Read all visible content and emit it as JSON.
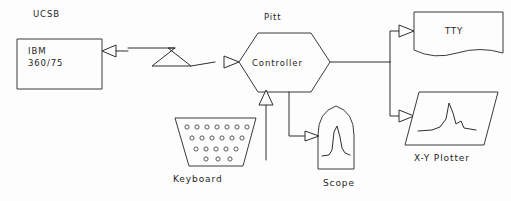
{
  "diagram": {
    "background_color": "#fdfdfd",
    "line_color": "#2e2e2e",
    "text_color": "#1e1e1e"
  },
  "nodes": {
    "mainframe": {
      "outer_label": "UCSB",
      "line1": "IBM",
      "line2": "360/75",
      "shape": "rectangle"
    },
    "controller": {
      "outer_label": "Pitt",
      "label": "Controller",
      "shape": "hexagon"
    },
    "keyboard": {
      "label": "Keyboard",
      "shape": "trapezoid",
      "key_rows": [
        7,
        6,
        5,
        3
      ]
    },
    "scope": {
      "label": "Scope",
      "shape": "crt-rounded-top",
      "display": "waveform-peak"
    },
    "tty": {
      "label": "TTY",
      "shape": "torn-paper-rectangle"
    },
    "plotter": {
      "label": "X-Y Plotter",
      "shape": "parallelogram",
      "display": "plotted-curve"
    }
  },
  "connectors": {
    "link_mainframe_controller": {
      "style": "lightning-bolt",
      "direction": "bidirectional"
    },
    "link_keyboard_controller": {
      "style": "line-arrow",
      "direction": "keyboard-to-controller"
    },
    "link_controller_scope": {
      "style": "line-arrow",
      "direction": "controller-to-scope"
    },
    "link_controller_tty": {
      "style": "line-arrow",
      "direction": "controller-to-tty"
    },
    "link_controller_plotter": {
      "style": "line-arrow",
      "direction": "controller-to-plotter"
    }
  }
}
